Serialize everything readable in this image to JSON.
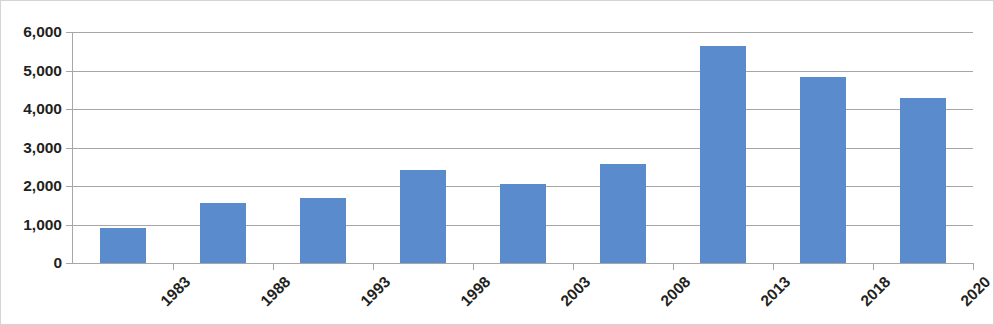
{
  "chart_data": {
    "type": "bar",
    "title": "",
    "subtitle": "",
    "xlabel": "",
    "ylabel": "",
    "categories": [
      "1983",
      "1988",
      "1993",
      "1998",
      "2003",
      "2008",
      "2013",
      "2018",
      "2020"
    ],
    "values": [
      920,
      1570,
      1700,
      2420,
      2050,
      2560,
      5630,
      4840,
      4280
    ],
    "series": [
      {
        "name": "",
        "values": [
          920,
          1570,
          1700,
          2420,
          2050,
          2560,
          5630,
          4840,
          4280
        ]
      }
    ],
    "ylim": [
      0,
      6000
    ],
    "y_ticks": [
      0,
      1000,
      2000,
      3000,
      4000,
      5000,
      6000
    ],
    "y_tick_labels": [
      "0",
      "1,000",
      "2,000",
      "3,000",
      "4,000",
      "5,000",
      "6,000"
    ],
    "grid": true,
    "legend": false,
    "legend_position": "none",
    "x_tick_label_rotation": -45,
    "annotations": []
  },
  "style": {
    "bar_color": "#5a8ccd",
    "gridline_color": "#a6a6a6",
    "axis_color": "#a6a6a6",
    "text_color": "#231f20",
    "plot_background": "#ffffff",
    "frame_border_color": "#d5d5d5"
  }
}
